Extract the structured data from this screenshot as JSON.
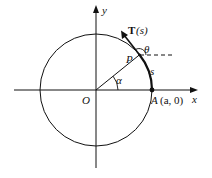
{
  "diagram": {
    "type": "unit-circle-arc-length",
    "axes": {
      "x_label": "x",
      "y_label": "y",
      "origin_label": "O"
    },
    "circle": {
      "center": "O",
      "radius_symbol": "a"
    },
    "points": {
      "P": {
        "label": "P"
      },
      "A": {
        "label": "A",
        "coords": "(a, 0)"
      }
    },
    "angles": {
      "alpha": "α",
      "theta": "θ"
    },
    "arc": {
      "label": "s"
    },
    "tangent": {
      "label_bold": "T",
      "label_arg": "(s)"
    }
  }
}
